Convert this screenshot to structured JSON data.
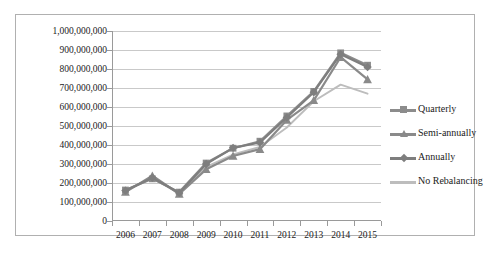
{
  "chart_data": {
    "type": "line",
    "title": "",
    "xlabel": "",
    "ylabel": "",
    "categories": [
      "2006",
      "2007",
      "2008",
      "2009",
      "2010",
      "2011",
      "2012",
      "2013",
      "2014",
      "2015"
    ],
    "ylim": [
      0,
      1000000000
    ],
    "ytick_values": [
      0,
      100000000,
      200000000,
      300000000,
      400000000,
      500000000,
      600000000,
      700000000,
      800000000,
      900000000,
      1000000000
    ],
    "ytick_labels": [
      "0",
      "100,000,000",
      "200,000,000",
      "300,000,000",
      "400,000,000",
      "500,000,000",
      "600,000,000",
      "700,000,000",
      "800,000,000",
      "900,000,000",
      "1,000,000,000"
    ],
    "grid": true,
    "legend_position": "right",
    "series": [
      {
        "name": "Quarterly",
        "marker": "square",
        "color": "#8c8c8c",
        "values": [
          163000000,
          222000000,
          152000000,
          305000000,
          383000000,
          420000000,
          553000000,
          682000000,
          885000000,
          820000000
        ]
      },
      {
        "name": "Semi-annually",
        "marker": "triangle",
        "color": "#8a8a8a",
        "values": [
          152000000,
          238000000,
          142000000,
          272000000,
          342000000,
          378000000,
          532000000,
          635000000,
          862000000,
          745000000
        ]
      },
      {
        "name": "Annually",
        "marker": "diamond",
        "color": "#7e7e7e",
        "values": [
          160000000,
          228000000,
          148000000,
          300000000,
          385000000,
          413000000,
          545000000,
          678000000,
          878000000,
          810000000
        ]
      },
      {
        "name": "No Rebalancing",
        "marker": "none",
        "color": "#bdbdbd",
        "values": [
          158000000,
          225000000,
          145000000,
          285000000,
          350000000,
          390000000,
          492000000,
          630000000,
          718000000,
          670000000
        ]
      }
    ]
  },
  "legend": {
    "entries": [
      {
        "label": "Quarterly"
      },
      {
        "label": "Semi-annually"
      },
      {
        "label": "Annually"
      },
      {
        "label": "No Rebalancing"
      }
    ]
  }
}
